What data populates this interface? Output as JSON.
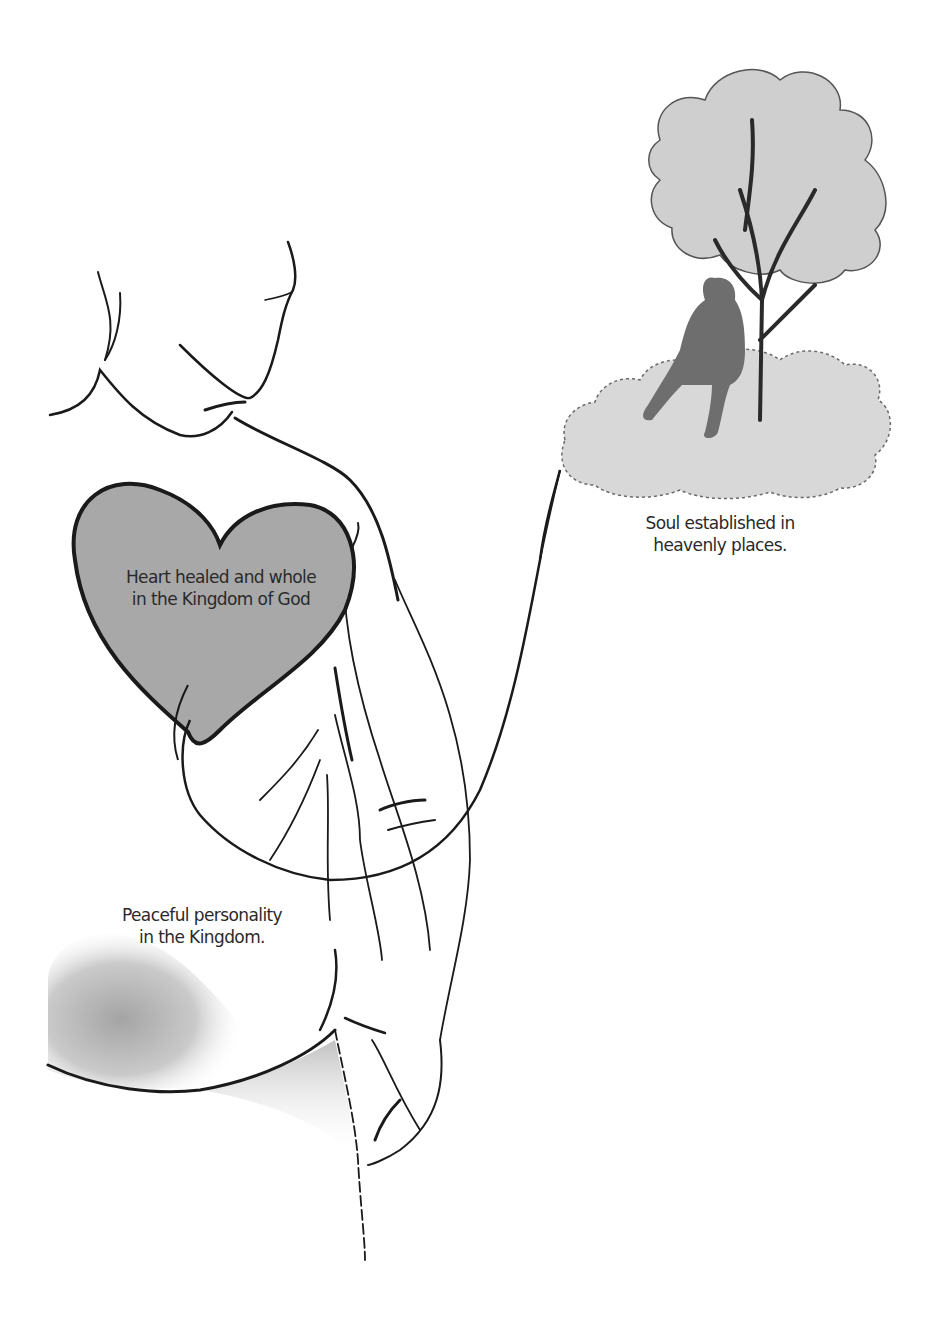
{
  "illustration": {
    "colors": {
      "background": "#ffffff",
      "ink": "#1a1a1a",
      "heart_fill": "#a8a8a8",
      "cloud_fill": "#d8d8d8",
      "tree_fill": "#cfcfcf",
      "silhouette": "#6e6e6e",
      "shadow": "#bdbdbd"
    },
    "labels": {
      "heart": {
        "line1": "Heart healed and whole",
        "line2": "in the  Kingdom of God"
      },
      "soul": {
        "line1": "Soul established in",
        "line2": "heavenly places."
      },
      "personality": {
        "line1": "Peaceful personality",
        "line2": "in the  Kingdom."
      }
    }
  }
}
